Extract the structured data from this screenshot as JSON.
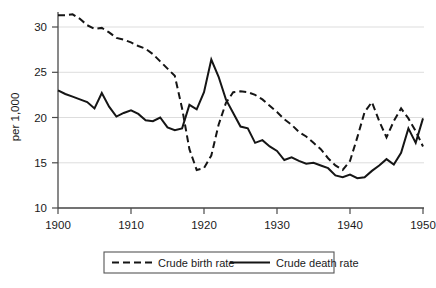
{
  "chart_data": {
    "type": "line",
    "title": "",
    "xlabel": "",
    "ylabel": "per 1,000",
    "xlim": [
      1900,
      1950
    ],
    "ylim": [
      10,
      32
    ],
    "grid": true,
    "legend_position": "bottom",
    "xticks": [
      1900,
      1910,
      1920,
      1930,
      1940,
      1950
    ],
    "yticks": [
      10,
      15,
      20,
      25,
      30
    ],
    "x": [
      1900,
      1901,
      1902,
      1903,
      1904,
      1905,
      1906,
      1907,
      1908,
      1909,
      1910,
      1911,
      1912,
      1913,
      1914,
      1915,
      1916,
      1917,
      1918,
      1919,
      1920,
      1921,
      1922,
      1923,
      1924,
      1925,
      1926,
      1927,
      1928,
      1929,
      1930,
      1931,
      1932,
      1933,
      1934,
      1935,
      1936,
      1937,
      1938,
      1939,
      1940,
      1941,
      1942,
      1943,
      1944,
      1945,
      1946,
      1947,
      1948,
      1949,
      1950
    ],
    "series": [
      {
        "name": "Crude birth rate",
        "style": "dashed",
        "values": [
          31.3,
          31.3,
          31.4,
          30.9,
          30.2,
          29.8,
          29.9,
          29.4,
          28.8,
          28.6,
          28.3,
          27.9,
          27.6,
          27.0,
          26.2,
          25.4,
          24.6,
          21.0,
          16.5,
          14.2,
          14.4,
          15.8,
          19.2,
          21.6,
          22.8,
          22.9,
          22.8,
          22.5,
          22.0,
          21.3,
          20.6,
          19.8,
          19.2,
          18.4,
          17.9,
          17.2,
          16.5,
          15.5,
          14.7,
          14.2,
          15.2,
          17.8,
          20.6,
          21.7,
          19.6,
          17.8,
          19.6,
          21.0,
          19.9,
          18.5,
          16.8
        ]
      },
      {
        "name": "Crude death rate",
        "style": "solid",
        "values": [
          23.0,
          22.6,
          22.3,
          22.0,
          21.7,
          21.0,
          22.7,
          21.2,
          20.1,
          20.5,
          20.8,
          20.4,
          19.7,
          19.6,
          20.0,
          18.9,
          18.6,
          18.8,
          21.4,
          20.9,
          22.8,
          26.4,
          24.5,
          22.0,
          20.5,
          19.0,
          18.8,
          17.2,
          17.5,
          16.8,
          16.3,
          15.3,
          15.6,
          15.2,
          14.9,
          15.0,
          14.7,
          14.4,
          13.6,
          13.4,
          13.7,
          13.3,
          13.4,
          14.1,
          14.7,
          15.4,
          14.8,
          16.1,
          18.8,
          17.2,
          19.9
        ]
      }
    ]
  },
  "axis": {
    "y_label": "per 1,000",
    "x_tick_labels": [
      "1900",
      "1910",
      "1920",
      "1930",
      "1940",
      "1950"
    ],
    "y_tick_labels": [
      "10",
      "15",
      "20",
      "25",
      "30"
    ]
  },
  "legend": {
    "entries": [
      {
        "label": "Crude birth rate",
        "style": "dashed"
      },
      {
        "label": "Crude death rate",
        "style": "solid"
      }
    ]
  },
  "colors": {
    "line": "#151515",
    "grid": "#d9d9d9",
    "axis": "#4a4a4a",
    "background": "#ffffff"
  }
}
